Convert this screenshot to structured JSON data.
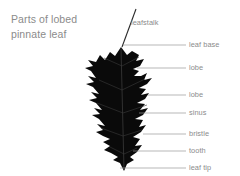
{
  "figure": {
    "title_line1": "Parts of lobed",
    "title_line2": "pinnate leaf",
    "title_color": "#8b8b8b",
    "background_color": "#ffffff",
    "leaf_color": "#0a0a0a",
    "leader_line_color": "#9a9a9a",
    "label_color": "#8b8b8b",
    "subject": "lobed pinnate leaf"
  },
  "labels": [
    {
      "id": "leafstalk",
      "text": "leafstalk",
      "x": 131,
      "y": 18
    },
    {
      "id": "leaf-base",
      "text": "leaf base",
      "x": 189,
      "y": 40
    },
    {
      "id": "lobe-upper",
      "text": "lobe",
      "x": 189,
      "y": 63
    },
    {
      "id": "lobe-lower",
      "text": "lobe",
      "x": 189,
      "y": 90
    },
    {
      "id": "sinus",
      "text": "sinus",
      "x": 189,
      "y": 108
    },
    {
      "id": "bristle",
      "text": "bristle",
      "x": 189,
      "y": 129
    },
    {
      "id": "tooth",
      "text": "tooth",
      "x": 189,
      "y": 146
    },
    {
      "id": "leaf-tip",
      "text": "leaf tip",
      "x": 189,
      "y": 163
    }
  ]
}
